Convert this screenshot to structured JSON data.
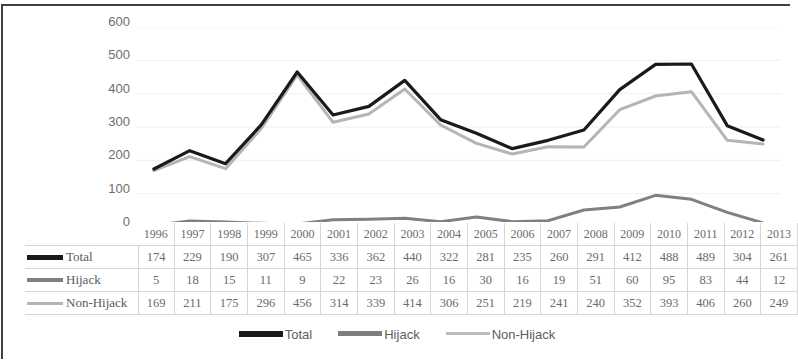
{
  "chart_data": {
    "type": "line",
    "title": "",
    "xlabel": "",
    "ylabel": "",
    "ylim": [
      0,
      600
    ],
    "yticks": [
      600,
      500,
      400,
      300,
      200,
      100,
      0
    ],
    "grid": true,
    "legend_position": "bottom",
    "categories": [
      "1996",
      "1997",
      "1998",
      "1999",
      "2000",
      "2001",
      "2002",
      "2003",
      "2004",
      "2005",
      "2006",
      "2007",
      "2008",
      "2009",
      "2010",
      "2011",
      "2012",
      "2013"
    ],
    "series": [
      {
        "name": "Total",
        "color": "#1a1a1a",
        "values": [
          174,
          229,
          190,
          307,
          465,
          336,
          362,
          440,
          322,
          281,
          235,
          260,
          291,
          412,
          488,
          489,
          304,
          261
        ]
      },
      {
        "name": "Hijack",
        "color": "#808080",
        "values": [
          5,
          18,
          15,
          11,
          9,
          22,
          23,
          26,
          16,
          30,
          16,
          19,
          51,
          60,
          95,
          83,
          44,
          12
        ]
      },
      {
        "name": "Non-Hijack",
        "color": "#b5b5b5",
        "values": [
          169,
          211,
          175,
          296,
          456,
          314,
          339,
          414,
          306,
          251,
          219,
          241,
          240,
          352,
          393,
          406,
          260,
          249
        ]
      }
    ]
  },
  "data_table": {
    "corner_label": "",
    "header": [
      "1996",
      "1997",
      "1998",
      "1999",
      "2000",
      "2001",
      "2002",
      "2003",
      "2004",
      "2005",
      "2006",
      "2007",
      "2008",
      "2009",
      "2010",
      "2011",
      "2012",
      "2013"
    ],
    "rows": [
      {
        "label": "Total",
        "swatch": "total-line-swatch",
        "values": [
          "174",
          "229",
          "190",
          "307",
          "465",
          "336",
          "362",
          "440",
          "322",
          "281",
          "235",
          "260",
          "291",
          "412",
          "488",
          "489",
          "304",
          "261"
        ]
      },
      {
        "label": "Hijack",
        "swatch": "hijack-line-swatch",
        "values": [
          "5",
          "18",
          "15",
          "11",
          "9",
          "22",
          "23",
          "26",
          "16",
          "30",
          "16",
          "19",
          "51",
          "60",
          "95",
          "83",
          "44",
          "12"
        ]
      },
      {
        "label": "Non-Hijack",
        "swatch": "non-hijack-line-swatch",
        "values": [
          "169",
          "211",
          "175",
          "296",
          "456",
          "314",
          "339",
          "414",
          "306",
          "251",
          "219",
          "241",
          "240",
          "352",
          "393",
          "406",
          "260",
          "249"
        ]
      }
    ]
  },
  "legend": {
    "items": [
      {
        "label": "Total",
        "color": "#1a1a1a"
      },
      {
        "label": "Hijack",
        "color": "#7d7d7d"
      },
      {
        "label": "Non-Hijack",
        "color": "#bcbcbc"
      }
    ]
  }
}
